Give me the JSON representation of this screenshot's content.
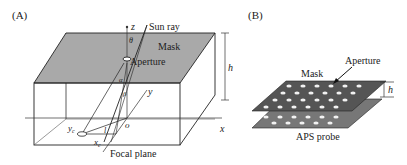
{
  "panel_a": {
    "label": "(A)",
    "sun_ray": "Sun ray",
    "mask": "Mask",
    "aperture": "Aperture",
    "z_axis": "z",
    "x_axis": "x",
    "y_axis": "y",
    "theta": "θ",
    "alpha": "α",
    "beta": "β",
    "h": "h",
    "yc": "y",
    "yc_sub": "c",
    "xc": "x",
    "xc_sub": "c",
    "l": "l",
    "o": "o",
    "focal_plane": "Focal plane"
  },
  "panel_b": {
    "label": "(B)",
    "aperture": "Aperture",
    "mask": "Mask",
    "h": "h",
    "probe": "APS probe"
  },
  "colors": {
    "mask_fill": "#a9a9a9",
    "mask_b_fill": "#555555",
    "probe_fill": "#777777",
    "hole": "#f2f2f2",
    "line": "#222222"
  }
}
